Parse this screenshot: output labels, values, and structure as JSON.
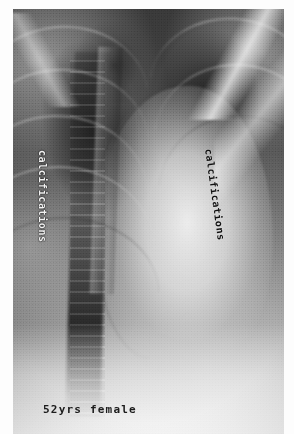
{
  "image": {
    "modality": "chest-radiograph",
    "view": "lateral-chest-x-ray",
    "width": 294,
    "height": 434,
    "background_color": "#ffffff",
    "film_border_color": "#fdfdfd"
  },
  "annotations": {
    "left_calcification": {
      "text": "calcifications",
      "color": "#f2f2f2",
      "rotation_deg": 90
    },
    "right_calcification": {
      "text": "calcifications",
      "color": "#111111",
      "rotation_deg": 82
    },
    "patient_info": {
      "text": "52yrs  female",
      "color": "#1c1c1c"
    }
  },
  "anatomy": {
    "regions": [
      {
        "name": "left-lung-field",
        "tone": "dark"
      },
      {
        "name": "right-lung-field",
        "tone": "dark"
      },
      {
        "name": "aortic-mass",
        "tone": "bright"
      },
      {
        "name": "spine-column",
        "tone": "dark"
      },
      {
        "name": "trachea",
        "tone": "mixed"
      },
      {
        "name": "diaphragm",
        "tone": "bright"
      }
    ]
  }
}
